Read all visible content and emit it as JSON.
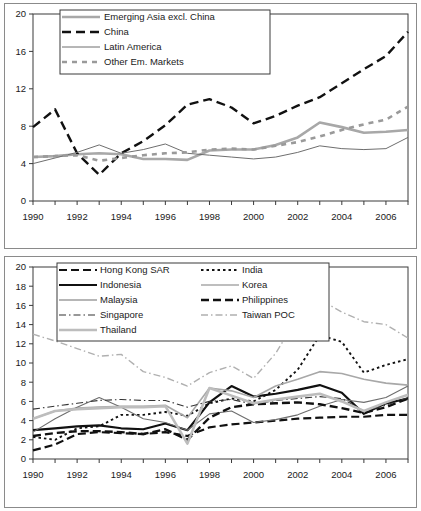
{
  "figure": {
    "panel_count": 2,
    "background": "#ffffff",
    "frame_color": "#8a8a8a"
  },
  "chart_data": [
    {
      "id": "top",
      "type": "line",
      "title": "",
      "subtitle": "",
      "xlabel": "",
      "ylabel": "",
      "xlim": [
        1990,
        2007
      ],
      "ylim": [
        0,
        20
      ],
      "yticks": [
        0,
        4,
        8,
        12,
        16,
        20
      ],
      "ytick_labels": [
        "0",
        "4",
        "8",
        "12",
        "16",
        "20"
      ],
      "xticks": [
        1990,
        1991,
        1992,
        1993,
        1994,
        1995,
        1996,
        1997,
        1998,
        1999,
        2000,
        2001,
        2002,
        2003,
        2004,
        2005,
        2006,
        2007
      ],
      "xtick_labels_shown": [
        "1990",
        "1992",
        "1994",
        "1996",
        "1998",
        "2000",
        "2002",
        "2004",
        "2006"
      ],
      "grid": false,
      "legend_position": "top-left-inside",
      "x": [
        1990,
        1991,
        1992,
        1993,
        1994,
        1995,
        1996,
        1997,
        1998,
        1999,
        2000,
        2001,
        2002,
        2003,
        2004,
        2005,
        2006,
        2007
      ],
      "series": [
        {
          "name": "Emerging Asia excl. China",
          "color": "#a8a8a8",
          "width": 2.6,
          "dash": "none",
          "values": [
            4.7,
            4.8,
            5.0,
            5.1,
            5.0,
            4.5,
            4.5,
            4.4,
            5.4,
            5.5,
            5.5,
            6.0,
            6.8,
            8.4,
            7.9,
            7.3,
            7.4,
            7.6
          ]
        },
        {
          "name": "China",
          "color": "#111111",
          "width": 2.4,
          "dash": "9,5",
          "values": [
            7.9,
            9.8,
            5.1,
            2.8,
            5.1,
            6.4,
            8.1,
            10.3,
            10.9,
            10.0,
            8.3,
            9.1,
            10.2,
            11.1,
            12.6,
            14.1,
            15.5,
            18.1
          ]
        },
        {
          "name": "Latin America",
          "color": "#6e6e6e",
          "width": 1.0,
          "dash": "none",
          "values": [
            4.0,
            4.6,
            5.2,
            6.0,
            5.1,
            5.5,
            6.1,
            5.1,
            4.9,
            4.7,
            4.5,
            4.7,
            5.2,
            5.9,
            5.6,
            5.5,
            5.6,
            6.8
          ]
        },
        {
          "name": "Other Em. Markets",
          "color": "#9a9a9a",
          "width": 2.6,
          "dash": "5,5",
          "values": [
            4.7,
            4.8,
            4.9,
            4.3,
            4.6,
            4.9,
            5.1,
            5.2,
            5.5,
            5.6,
            5.5,
            5.9,
            6.3,
            6.9,
            7.6,
            8.2,
            8.7,
            10.1
          ]
        }
      ]
    },
    {
      "id": "bottom",
      "type": "line",
      "title": "",
      "subtitle": "",
      "xlabel": "",
      "ylabel": "",
      "xlim": [
        1990,
        2007
      ],
      "ylim": [
        0,
        20
      ],
      "yticks": [
        0,
        2,
        4,
        6,
        8,
        10,
        12,
        14,
        16,
        18,
        20
      ],
      "ytick_labels": [
        "0",
        "2",
        "4",
        "6",
        "8",
        "10",
        "12",
        "14",
        "16",
        "18",
        "20"
      ],
      "xticks": [
        1990,
        1991,
        1992,
        1993,
        1994,
        1995,
        1996,
        1997,
        1998,
        1999,
        2000,
        2001,
        2002,
        2003,
        2004,
        2005,
        2006,
        2007
      ],
      "xtick_labels_shown": [
        "1990",
        "1992",
        "1994",
        "1996",
        "1998",
        "2000",
        "2002",
        "2004",
        "2006"
      ],
      "grid": false,
      "legend_position": "top-left-inside",
      "x": [
        1990,
        1991,
        1992,
        1993,
        1994,
        1995,
        1996,
        1997,
        1998,
        1999,
        2000,
        2001,
        2002,
        2003,
        2004,
        2005,
        2006,
        2007
      ],
      "series": [
        {
          "name": "Hong Kong SAR",
          "color": "#111111",
          "width": 2.2,
          "dash": "8,4",
          "values": [
            0.9,
            1.5,
            2.6,
            2.8,
            2.7,
            2.6,
            2.8,
            2.4,
            3.3,
            3.6,
            3.8,
            4.0,
            4.2,
            4.3,
            4.4,
            4.4,
            4.6,
            4.6
          ]
        },
        {
          "name": "India",
          "color": "#111111",
          "width": 1.9,
          "dash": "2.5,3",
          "values": [
            2.3,
            2.0,
            3.2,
            3.4,
            4.6,
            4.6,
            4.9,
            4.5,
            5.8,
            6.3,
            6.0,
            7.2,
            9.3,
            12.9,
            12.2,
            9.0,
            9.8,
            10.4
          ]
        },
        {
          "name": "Indonesia",
          "color": "#111111",
          "width": 2.2,
          "dash": "none",
          "values": [
            3.0,
            3.2,
            3.4,
            3.5,
            3.2,
            3.1,
            3.7,
            3.0,
            5.9,
            7.6,
            6.5,
            6.8,
            7.2,
            7.7,
            6.9,
            4.7,
            5.8,
            6.3
          ]
        },
        {
          "name": "Korea",
          "color": "#a8a8a8",
          "width": 1.6,
          "dash": "none",
          "values": [
            4.2,
            5.0,
            5.3,
            5.4,
            5.5,
            5.5,
            5.6,
            4.3,
            7.4,
            7.1,
            6.4,
            7.6,
            8.3,
            9.1,
            8.9,
            8.3,
            7.9,
            7.7
          ]
        },
        {
          "name": "Malaysia",
          "color": "#6e6e6e",
          "width": 1.1,
          "dash": "none",
          "values": [
            2.8,
            4.2,
            5.4,
            6.4,
            5.4,
            4.2,
            3.8,
            3.0,
            4.7,
            5.0,
            3.8,
            4.1,
            4.6,
            5.5,
            6.2,
            5.9,
            6.4,
            7.6
          ]
        },
        {
          "name": "Philippines",
          "color": "#111111",
          "width": 2.4,
          "dash": "8,4",
          "values": [
            2.4,
            2.7,
            2.9,
            2.9,
            2.8,
            2.6,
            3.1,
            2.0,
            4.3,
            5.4,
            5.7,
            5.8,
            5.9,
            5.7,
            5.3,
            4.8,
            5.4,
            6.3
          ]
        },
        {
          "name": "Singapore",
          "color": "#333333",
          "width": 1.1,
          "dash": "7,3,1.5,3",
          "values": [
            5.2,
            5.5,
            5.8,
            6.1,
            6.2,
            6.1,
            6.1,
            5.4,
            6.0,
            6.2,
            5.7,
            6.1,
            6.3,
            6.5,
            6.3,
            5.0,
            5.6,
            6.4
          ]
        },
        {
          "name": "Taiwan POC",
          "color": "#b0b0b0",
          "width": 1.4,
          "dash": "7,3,1.5,3",
          "values": [
            13.0,
            12.3,
            11.5,
            10.7,
            10.9,
            9.1,
            8.5,
            7.6,
            9.0,
            9.7,
            8.4,
            11.0,
            14.8,
            16.6,
            15.3,
            14.3,
            14.0,
            12.6
          ]
        },
        {
          "name": "Thailand",
          "color": "#bdbdbd",
          "width": 2.6,
          "dash": "none",
          "values": [
            4.2,
            5.0,
            5.2,
            5.3,
            5.4,
            5.4,
            5.5,
            1.6,
            7.4,
            6.6,
            5.8,
            6.2,
            6.5,
            6.8,
            6.0,
            5.0,
            5.9,
            6.7
          ]
        }
      ]
    }
  ]
}
